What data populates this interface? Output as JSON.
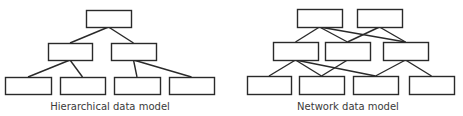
{
  "colors": {
    "stroke": "#2a2a2a",
    "text": "#3a3a3a",
    "background": "#ffffff"
  },
  "hierarchical": {
    "caption": "Hierarchical data model",
    "caption_pos": {
      "x": 110,
      "y": 101
    },
    "nodes": [
      {
        "id": "h-root",
        "x": 86,
        "y": 10,
        "w": 45,
        "h": 17
      },
      {
        "id": "h-m1",
        "x": 48,
        "y": 43,
        "w": 44,
        "h": 17
      },
      {
        "id": "h-m2",
        "x": 111,
        "y": 43,
        "w": 45,
        "h": 17
      },
      {
        "id": "h-b1",
        "x": 5,
        "y": 77,
        "w": 46,
        "h": 17
      },
      {
        "id": "h-b2",
        "x": 60,
        "y": 77,
        "w": 45,
        "h": 17
      },
      {
        "id": "h-b3",
        "x": 114,
        "y": 77,
        "w": 46,
        "h": 17
      },
      {
        "id": "h-b4",
        "x": 169,
        "y": 77,
        "w": 45,
        "h": 17
      }
    ],
    "edges": [
      [
        "h-root",
        "h-m1"
      ],
      [
        "h-root",
        "h-m2"
      ],
      [
        "h-m1",
        "h-b1"
      ],
      [
        "h-m1",
        "h-b2"
      ],
      [
        "h-m2",
        "h-b3"
      ],
      [
        "h-m2",
        "h-b4"
      ]
    ]
  },
  "network": {
    "caption": "Network data model",
    "caption_pos": {
      "x": 348,
      "y": 101
    },
    "nodes": [
      {
        "id": "n-t1",
        "x": 297,
        "y": 9,
        "w": 45,
        "h": 18
      },
      {
        "id": "n-t2",
        "x": 357,
        "y": 9,
        "w": 45,
        "h": 18
      },
      {
        "id": "n-m1",
        "x": 273,
        "y": 42,
        "w": 45,
        "h": 18
      },
      {
        "id": "n-m2",
        "x": 325,
        "y": 42,
        "w": 45,
        "h": 18
      },
      {
        "id": "n-m3",
        "x": 383,
        "y": 42,
        "w": 45,
        "h": 18
      },
      {
        "id": "n-b1",
        "x": 247,
        "y": 76,
        "w": 44,
        "h": 18
      },
      {
        "id": "n-b2",
        "x": 299,
        "y": 76,
        "w": 45,
        "h": 18
      },
      {
        "id": "n-b3",
        "x": 353,
        "y": 76,
        "w": 45,
        "h": 18
      },
      {
        "id": "n-b4",
        "x": 409,
        "y": 76,
        "w": 45,
        "h": 18
      }
    ],
    "edges": [
      [
        "n-t1",
        "n-m1"
      ],
      [
        "n-t1",
        "n-m2"
      ],
      [
        "n-t1",
        "n-m3"
      ],
      [
        "n-t2",
        "n-m2"
      ],
      [
        "n-t2",
        "n-m3"
      ],
      [
        "n-m1",
        "n-b1"
      ],
      [
        "n-m1",
        "n-b2"
      ],
      [
        "n-m1",
        "n-b3"
      ],
      [
        "n-m2",
        "n-b2"
      ],
      [
        "n-m3",
        "n-b3"
      ],
      [
        "n-m3",
        "n-b4"
      ]
    ]
  }
}
